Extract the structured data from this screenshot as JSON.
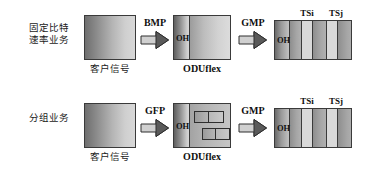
{
  "diagram": {
    "title_present": false,
    "rows": [
      {
        "id": "row-cbr",
        "service_label_line1": "固定比特",
        "service_label_line2": "速率业务",
        "client_caption": "客户信号",
        "mapping_label": "BMP",
        "oduflex_caption": "ODUflex",
        "oduflex_oh_label": "OH",
        "second_mapping_label": "GMP",
        "timeslot_labels": [
          "TSi",
          "TSj"
        ],
        "timeslot_oh_label": "OH"
      },
      {
        "id": "row-packet",
        "service_label_line1": "分组业务",
        "service_label_line2": "",
        "client_caption": "客户信号",
        "mapping_label": "GFP",
        "oduflex_caption": "ODUflex",
        "oduflex_oh_label": "OH",
        "second_mapping_label": "GMP",
        "timeslot_labels": [
          "TSi",
          "TSj"
        ],
        "timeslot_oh_label": "OH"
      }
    ],
    "colors": {
      "outline": "#3a3a3a",
      "text": "#101010",
      "slot_highlight": "#d9d9d9",
      "background": "#ffffff"
    }
  }
}
